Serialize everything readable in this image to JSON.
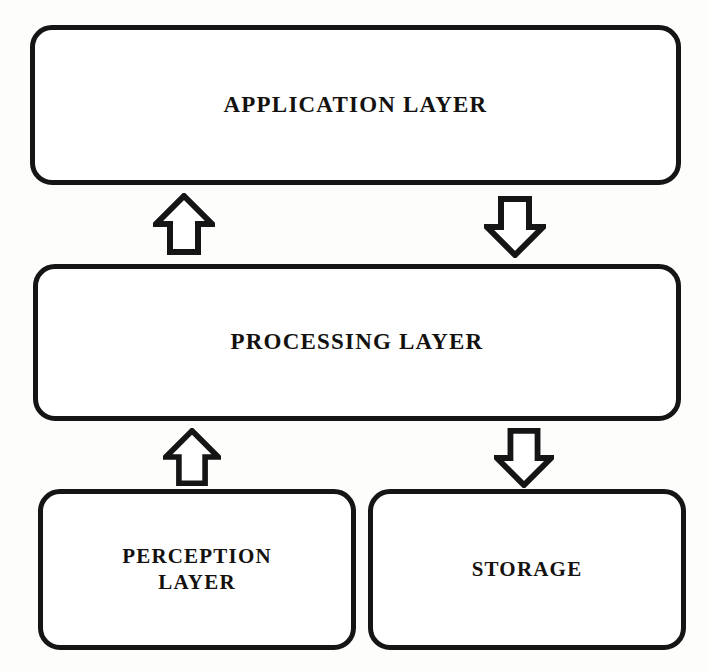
{
  "diagram": {
    "stroke_color": "#151515",
    "fill_color": "#ffffff",
    "boxes": [
      {
        "id": "application",
        "label": "APPLICATION LAYER"
      },
      {
        "id": "processing",
        "label": "PROCESSING LAYER"
      },
      {
        "id": "perception",
        "label": "PERCEPTION\nLAYER"
      },
      {
        "id": "storage",
        "label": "STORAGE"
      }
    ],
    "arrows": [
      {
        "id": "application-up",
        "direction": "up",
        "from": "PROCESSING LAYER",
        "to": "APPLICATION LAYER"
      },
      {
        "id": "application-down",
        "direction": "down",
        "from": "APPLICATION LAYER",
        "to": "PROCESSING LAYER"
      },
      {
        "id": "perception-up",
        "direction": "up",
        "from": "PERCEPTION LAYER",
        "to": "PROCESSING LAYER"
      },
      {
        "id": "storage-down",
        "direction": "down",
        "from": "PROCESSING LAYER",
        "to": "STORAGE"
      }
    ],
    "scan_artifacts": [
      "",
      "",
      ""
    ]
  }
}
